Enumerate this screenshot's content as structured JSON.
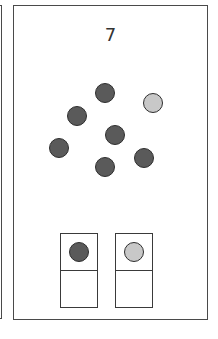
{
  "card": {
    "number": "7",
    "colors": {
      "dark": "#5a5a5a",
      "light": "#c8c8c8"
    },
    "scatter_dots": [
      {
        "tone": "dark"
      },
      {
        "tone": "light"
      },
      {
        "tone": "dark"
      },
      {
        "tone": "dark"
      },
      {
        "tone": "dark"
      },
      {
        "tone": "dark"
      },
      {
        "tone": "dark"
      }
    ],
    "legend_slots": [
      {
        "top_tone": "dark",
        "bottom": "empty"
      },
      {
        "top_tone": "light",
        "bottom": "empty"
      }
    ]
  }
}
